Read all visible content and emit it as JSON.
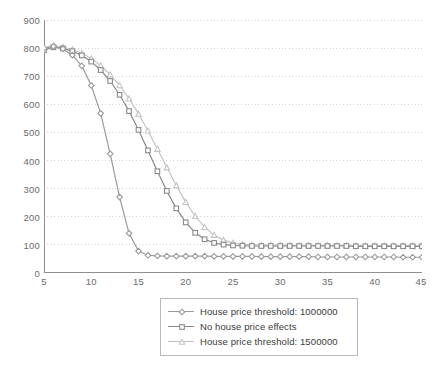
{
  "chart_data": {
    "type": "line",
    "title": "",
    "subtitle": "",
    "xlabel": "",
    "ylabel": "",
    "xlim": [
      5,
      45
    ],
    "ylim": [
      0,
      900
    ],
    "xticks": [
      5,
      10,
      15,
      20,
      25,
      30,
      35,
      40,
      45
    ],
    "yticks": [
      0,
      100,
      200,
      300,
      400,
      500,
      600,
      700,
      800,
      900
    ],
    "grid": "horizontal-dotted",
    "legend_position": "below-center",
    "x": [
      5,
      6,
      7,
      8,
      9,
      10,
      11,
      12,
      13,
      14,
      15,
      16,
      17,
      18,
      19,
      20,
      21,
      22,
      23,
      24,
      25,
      26,
      27,
      28,
      29,
      30,
      31,
      32,
      33,
      34,
      35,
      36,
      37,
      38,
      39,
      40,
      41,
      42,
      43,
      44,
      45
    ],
    "series": [
      {
        "name": "House price threshold: 1000000",
        "color": "#9a9a9a",
        "marker": "diamond",
        "values": [
          800,
          806,
          797,
          775,
          737,
          667,
          568,
          424,
          270,
          141,
          78,
          63,
          61,
          60,
          60,
          60,
          60,
          60,
          59,
          59,
          59,
          59,
          59,
          58,
          58,
          58,
          58,
          58,
          58,
          57,
          57,
          57,
          57,
          57,
          57,
          57,
          57,
          57,
          56,
          56,
          56
        ]
      },
      {
        "name": "No house price effects",
        "color": "#8a8a8a",
        "marker": "square",
        "values": [
          793,
          803,
          799,
          789,
          774,
          752,
          722,
          683,
          634,
          576,
          509,
          436,
          362,
          292,
          230,
          180,
          143,
          120,
          107,
          101,
          98,
          97,
          96,
          96,
          96,
          96,
          96,
          96,
          96,
          96,
          96,
          96,
          96,
          95,
          95,
          95,
          95,
          95,
          95,
          95,
          95
        ]
      },
      {
        "name": "House price threshold: 1500000",
        "color": "#c4c4c4",
        "marker": "triangle",
        "values": [
          800,
          810,
          804,
          795,
          782,
          763,
          738,
          706,
          667,
          620,
          566,
          506,
          441,
          375,
          311,
          252,
          202,
          163,
          135,
          117,
          107,
          102,
          100,
          99,
          99,
          99,
          98,
          98,
          98,
          98,
          98,
          98,
          98,
          97,
          97,
          97,
          97,
          97,
          97,
          97,
          97
        ]
      }
    ]
  },
  "axis": {
    "y_tick_labels": [
      "900",
      "800",
      "700",
      "600",
      "500",
      "400",
      "300",
      "200",
      "100",
      "0"
    ],
    "x_tick_labels": [
      "5",
      "10",
      "15",
      "20",
      "25",
      "30",
      "35",
      "40",
      "45"
    ]
  },
  "legend": {
    "entries": [
      {
        "label": "House price threshold: 1000000",
        "color": "#9a9a9a",
        "marker": "diamond"
      },
      {
        "label": "No house price effects",
        "color": "#8a8a8a",
        "marker": "square"
      },
      {
        "label": "House price threshold: 1500000",
        "color": "#c4c4c4",
        "marker": "triangle"
      }
    ]
  },
  "style": {
    "axis_color": "#8e8e8e",
    "grid_color": "#e2cfd4",
    "tick_text_color": "#6b6b6b",
    "legend_border_color": "#b9b9b9",
    "background": "#ffffff"
  }
}
